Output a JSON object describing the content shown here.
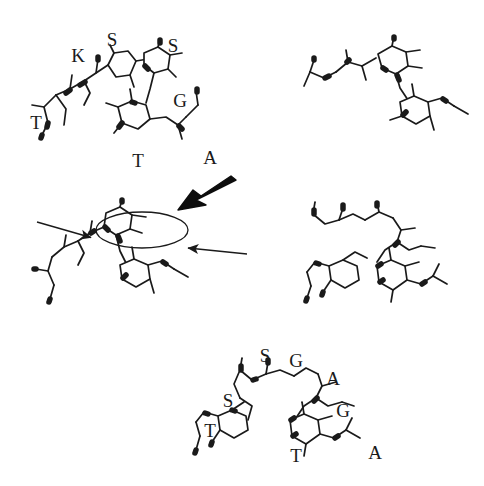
{
  "figure": {
    "background_color": "#ffffff",
    "ink_color": "#1a1a1a",
    "width": 484,
    "height": 486,
    "caption": ""
  },
  "panels": [
    {
      "id": "top-left",
      "name": "molecular-structure-top-left",
      "description": "Backbone model of an oligosaccharide/peptide segment with residue labels",
      "labels": [
        {
          "text": "K",
          "x": 78,
          "y": 55
        },
        {
          "text": "S",
          "x": 112,
          "y": 39
        },
        {
          "text": "S",
          "x": 173,
          "y": 45
        },
        {
          "text": "G",
          "x": 180,
          "y": 100
        },
        {
          "text": "T",
          "x": 36,
          "y": 122
        },
        {
          "text": "T",
          "x": 138,
          "y": 160
        },
        {
          "text": "A",
          "x": 210,
          "y": 157
        }
      ]
    },
    {
      "id": "top-right",
      "name": "molecular-structure-top-right",
      "description": "Unlabeled backbone model, alternate orientation",
      "labels": []
    },
    {
      "id": "middle-left",
      "name": "molecular-structure-middle-left-annotated",
      "description": "Backbone model with elliptical highlight and annotation arrows",
      "labels": []
    },
    {
      "id": "middle-right",
      "name": "molecular-structure-middle-right",
      "description": "Unlabeled extended backbone model",
      "labels": []
    },
    {
      "id": "bottom",
      "name": "molecular-structure-bottom",
      "description": "Backbone model with full residue labelling",
      "labels": [
        {
          "text": "S",
          "x": 265,
          "y": 355
        },
        {
          "text": "G",
          "x": 296,
          "y": 360
        },
        {
          "text": "A",
          "x": 333,
          "y": 378
        },
        {
          "text": "S",
          "x": 228,
          "y": 400
        },
        {
          "text": "G",
          "x": 343,
          "y": 410
        },
        {
          "text": "T",
          "x": 210,
          "y": 430
        },
        {
          "text": "T",
          "x": 296,
          "y": 455
        },
        {
          "text": "A",
          "x": 375,
          "y": 452
        }
      ]
    }
  ],
  "annotations": {
    "highlight_ellipse": {
      "name": "highlight-ellipse",
      "cx": 142,
      "cy": 230,
      "rx": 46,
      "ry": 18
    },
    "arrows": [
      {
        "name": "bold-pointer-arrow",
        "style": "bold",
        "x1": 230,
        "y1": 184,
        "x2": 181,
        "y2": 209
      },
      {
        "name": "thin-pointer-arrow-left",
        "style": "thin",
        "x1": 37,
        "y1": 222,
        "x2": 93,
        "y2": 238
      },
      {
        "name": "thin-pointer-arrow-right",
        "style": "thin",
        "x1": 246,
        "y1": 254,
        "x2": 186,
        "y2": 248
      }
    ]
  }
}
